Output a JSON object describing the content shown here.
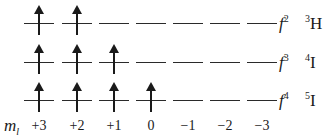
{
  "diagram": {
    "title": "",
    "orbital_x": [
      24,
      62,
      99,
      136,
      173,
      210,
      247
    ],
    "rows": [
      {
        "config_base": "f",
        "config_sup": "2",
        "term_sup": "3",
        "term_letter": "H",
        "filled": [
          true,
          true,
          false,
          false,
          false,
          false,
          false
        ],
        "top": 1
      },
      {
        "config_base": "f",
        "config_sup": "3",
        "term_sup": "4",
        "term_letter": "I",
        "filled": [
          true,
          true,
          true,
          false,
          false,
          false,
          false
        ],
        "top": 40
      },
      {
        "config_base": "f",
        "config_sup": "4",
        "term_sup": "5",
        "term_letter": "I",
        "filled": [
          true,
          true,
          true,
          true,
          false,
          false,
          false
        ],
        "top": 78
      }
    ],
    "ml_axis": {
      "label_base": "m",
      "label_sub": "l",
      "values": [
        "+3",
        "+2",
        "+1",
        "0",
        "−1",
        "−2",
        "−3"
      ]
    }
  }
}
